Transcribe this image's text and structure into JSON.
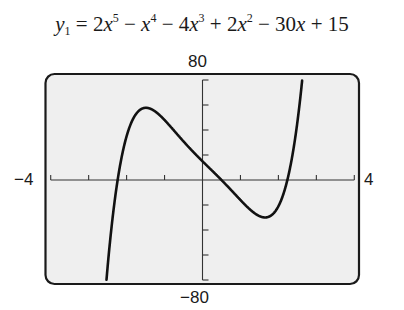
{
  "chart_data": {
    "type": "line",
    "title_parts": {
      "lhs_var": "y",
      "lhs_sub": "1",
      "terms": [
        {
          "text": " = 2",
          "var": "x",
          "exp": "5"
        },
        {
          "text": " − ",
          "var": "x",
          "exp": "4"
        },
        {
          "text": " − 4",
          "var": "x",
          "exp": "3"
        },
        {
          "text": " + 2",
          "var": "x",
          "exp": "2"
        },
        {
          "text": " − 30",
          "var": "x",
          "exp": ""
        },
        {
          "text": " + 15",
          "var": "",
          "exp": ""
        }
      ]
    },
    "coefficients": [
      2,
      -1,
      -4,
      2,
      -30,
      15
    ],
    "xlim": [
      -4,
      4
    ],
    "ylim": [
      -80,
      80
    ],
    "xscl": 1,
    "yscl": 20,
    "xmin_label": "−4",
    "xmax_label": "4",
    "ymax_label": "80",
    "ymin_label": "−80",
    "grid": false,
    "features": {
      "local_max": {
        "x": -1.55,
        "y": 57.4
      },
      "local_min": {
        "x": 1.6,
        "y": -20.5
      },
      "y_intercept": 15,
      "real_zeros_approx": [
        -2.24,
        0.5,
        2.24
      ]
    },
    "sample_points": [
      {
        "x": -2.6,
        "y": -80.0
      },
      {
        "x": -2.5,
        "y": -58.6
      },
      {
        "x": -2.0,
        "y": 27.0
      },
      {
        "x": -1.5,
        "y": 57.3
      },
      {
        "x": -1.0,
        "y": 48.0
      },
      {
        "x": 0.0,
        "y": 15.0
      },
      {
        "x": 1.0,
        "y": -16.0
      },
      {
        "x": 1.5,
        "y": -20.2
      },
      {
        "x": 2.0,
        "y": -13.0
      },
      {
        "x": 2.5,
        "y": 26.6
      },
      {
        "x": 2.75,
        "y": 80.0
      }
    ]
  },
  "colors": {
    "screen_bg": "#efefef",
    "frame": "#1a1a1a",
    "curve": "#111111",
    "axes": "#333333"
  }
}
